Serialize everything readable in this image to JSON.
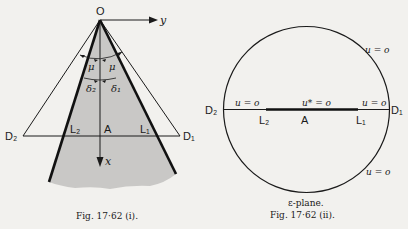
{
  "figure_i": {
    "caption": "Fig. 17·62 (i).",
    "origin_label": "O",
    "y_axis_label": "y",
    "x_axis_label": "x",
    "angle_labels": {
      "mu_left": "μ",
      "mu_right": "μ",
      "delta_left": "δ₂",
      "delta_right": "δ₁"
    },
    "point_labels": {
      "D2": "D₂",
      "D1": "D₁",
      "L2": "L₂",
      "L1": "L₁",
      "A": "A"
    },
    "colors": {
      "shade": "#c9c8c6",
      "line": "#1a1a1a"
    }
  },
  "figure_ii": {
    "caption": "Fig. 17·62 (ii).",
    "plane_label": "ε-plane.",
    "point_labels": {
      "D2": "D₂",
      "D1": "D₁",
      "L2": "L₂",
      "L1": "L₁",
      "A": "A"
    },
    "boundary_labels": {
      "upper_right": "u = o",
      "lower_right": "u = o",
      "left_segment": "u = o",
      "right_segment": "u = o",
      "center_segment": "u* = o"
    }
  }
}
